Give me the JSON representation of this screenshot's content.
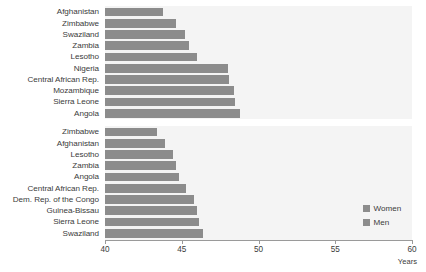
{
  "chart_data": {
    "type": "bar",
    "orientation": "horizontal",
    "title": "",
    "xlabel": "Years",
    "ylabel": "",
    "xlim": [
      40,
      60
    ],
    "xticks": [
      40,
      45,
      50,
      55,
      60
    ],
    "xtick_labels": [
      "40",
      "45",
      "50",
      "55",
      "60"
    ],
    "grid": false,
    "legend": {
      "position": "right-bottom",
      "entries": [
        {
          "label": "Women",
          "color": "#8c8c8c"
        },
        {
          "label": "Men",
          "color": "#8c8c8c"
        }
      ]
    },
    "panels": [
      {
        "name": "Women",
        "categories": [
          "Afghanistan",
          "Zimbabwe",
          "Swaziland",
          "Zambia",
          "Lesotho",
          "Nigeria",
          "Central African Rep.",
          "Mozambique",
          "Sierra Leone",
          "Angola"
        ],
        "values": [
          43.8,
          44.6,
          45.2,
          45.5,
          46.0,
          48.0,
          48.1,
          48.4,
          48.5,
          48.8
        ]
      },
      {
        "name": "Men",
        "categories": [
          "Zimbabwe",
          "Afghanistan",
          "Lesotho",
          "Zambia",
          "Angola",
          "Central African Rep.",
          "Dem. Rep. of the Congo",
          "Guinea-Bissau",
          "Sierra Leone",
          "Swaziland"
        ],
        "values": [
          43.4,
          43.9,
          44.4,
          44.6,
          44.8,
          45.3,
          45.8,
          46.0,
          46.1,
          46.4
        ]
      }
    ]
  },
  "axis": {
    "title": "Years"
  }
}
